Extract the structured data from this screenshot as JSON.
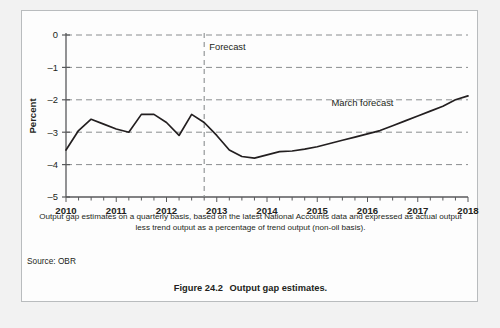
{
  "figure": {
    "number_label": "Figure 24.2",
    "title_label": "Output gap estimates.",
    "note": "Output gap estimates on a quarterly basis, based on the latest National Accounts data and expressed as actual output less trend output as a percentage of trend output (non-oil basis).",
    "source": "Source: OBR"
  },
  "colors": {
    "page_background": "#f2f2f2",
    "panel_background": "#fdfdfd",
    "panel_border": "#b9bcbe",
    "series_line": "#231f20",
    "gridline": "#8a8d8f",
    "axis": "#58595b",
    "text": "#231f20"
  },
  "chart_data": {
    "type": "line",
    "title": "",
    "subtitle": "",
    "xlabel": "",
    "ylabel": "Percent",
    "xlim": [
      2010.0,
      2018.0
    ],
    "ylim": [
      -5,
      0
    ],
    "yticks": [
      0,
      -1,
      -2,
      -3,
      -4,
      -5
    ],
    "ytick_labels": [
      "0",
      "–1",
      "–2",
      "–3",
      "–4",
      "–5"
    ],
    "xticks": [
      2010,
      2011,
      2012,
      2013,
      2014,
      2015,
      2016,
      2017,
      2018
    ],
    "xtick_labels": [
      "2010",
      "2011",
      "2012",
      "2013",
      "2014",
      "2015",
      "2016",
      "2017",
      "2018"
    ],
    "minor_xtick_interval": 0.25,
    "grid": "horizontal-dashed",
    "legend": "none",
    "annotations": [
      {
        "name": "forecast-divider-label",
        "text": "Forecast",
        "x": 2012.75,
        "y": -0.45,
        "type": "vertical-dashed-line-label"
      },
      {
        "name": "march-forecast-label",
        "text": "March forecast",
        "x": 2015.9,
        "y": -2.2,
        "type": "series-label"
      }
    ],
    "vertical_markers": [
      {
        "name": "forecast-start",
        "x": 2012.75,
        "style": "dashed"
      }
    ],
    "series": [
      {
        "name": "Output gap (March forecast)",
        "x": [
          2010.0,
          2010.25,
          2010.5,
          2010.75,
          2011.0,
          2011.25,
          2011.5,
          2011.75,
          2012.0,
          2012.25,
          2012.5,
          2012.75,
          2013.0,
          2013.25,
          2013.5,
          2013.75,
          2014.0,
          2014.25,
          2014.5,
          2014.75,
          2015.0,
          2015.25,
          2015.5,
          2015.75,
          2016.0,
          2016.25,
          2016.5,
          2016.75,
          2017.0,
          2017.25,
          2017.5,
          2017.75,
          2018.0
        ],
        "values": [
          -3.55,
          -2.95,
          -2.6,
          -2.75,
          -2.9,
          -3.0,
          -2.45,
          -2.45,
          -2.7,
          -3.1,
          -2.45,
          -2.7,
          -3.1,
          -3.55,
          -3.75,
          -3.8,
          -3.7,
          -3.6,
          -3.58,
          -3.52,
          -3.45,
          -3.35,
          -3.25,
          -3.15,
          -3.05,
          -2.95,
          -2.8,
          -2.65,
          -2.5,
          -2.35,
          -2.2,
          -2.0,
          -1.88
        ]
      }
    ]
  }
}
